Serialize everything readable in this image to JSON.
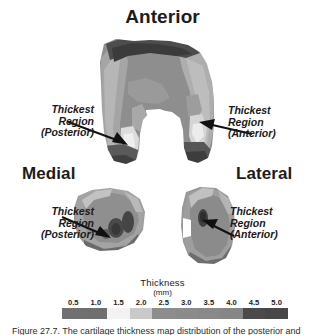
{
  "figure": {
    "orientation_labels": {
      "anterior": "Anterior",
      "medial": "Medial",
      "lateral": "Lateral"
    },
    "callouts": [
      {
        "id": "top-left",
        "line1": "Thickest",
        "line2": "Region",
        "line3": "(Posterior)"
      },
      {
        "id": "top-right",
        "line1": "Thickest",
        "line2": "Region",
        "line3": "(Anterior)"
      },
      {
        "id": "bottom-left",
        "line1": "Thickest",
        "line2": "Region",
        "line3": "(Posterior)"
      },
      {
        "id": "bottom-right",
        "line1": "Thickest",
        "line2": "Region",
        "line3": "(Anterior)"
      }
    ],
    "caption": "Figure 27.7. The cartilage thickness map distribution of the posterior and"
  },
  "chart_data": {
    "type": "heatmap",
    "title": "Thickness",
    "subtitle": "(mm)",
    "xlabel": "",
    "ylabel": "",
    "legend_position": "bottom",
    "grid": false,
    "colorbar": {
      "label": "Thickness",
      "units": "(mm)",
      "tick_labels": [
        "0.5",
        "1.0",
        "1.5",
        "2.0",
        "2.5",
        "3.0",
        "3.5",
        "4.0",
        "4.5",
        "5.0"
      ],
      "tick_values": [
        0.5,
        1.0,
        1.5,
        2.0,
        2.5,
        3.0,
        3.5,
        4.0,
        4.5,
        5.0
      ],
      "range": [
        0.25,
        5.25
      ],
      "swatch_colors": [
        "#707070",
        "#6f6f6f",
        "#f2f2f2",
        "#c9c9c9",
        "#8d8d8d",
        "#8b8b8b",
        "#898989",
        "#868686",
        "#4a4a4a",
        "#474747"
      ]
    },
    "panels": [
      {
        "name": "distal-femur-anterior-view",
        "view": "Anterior",
        "annotations": [
          "Thickest Region (Posterior)",
          "Thickest Region (Anterior)"
        ]
      },
      {
        "name": "medial-condyle-cross-section",
        "view": "Medial",
        "annotations": [
          "Thickest Region (Posterior)"
        ]
      },
      {
        "name": "lateral-condyle-cross-section",
        "view": "Lateral",
        "annotations": [
          "Thickest Region (Anterior)"
        ]
      }
    ]
  }
}
